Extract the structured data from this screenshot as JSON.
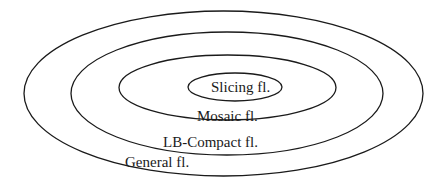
{
  "diagram": {
    "type": "nested-ellipses (Venn / set inclusion)",
    "colors": {
      "stroke": "#1a1a1a",
      "text": "#1a1a1a",
      "background": "#ffffff"
    },
    "sets": [
      {
        "id": "general",
        "label": "General fl.",
        "level": 0,
        "contains": "lb-compact"
      },
      {
        "id": "lb-compact",
        "label": "LB-Compact fl.",
        "level": 1,
        "contains": "mosaic"
      },
      {
        "id": "mosaic",
        "label": "Mosaic fl.",
        "level": 2,
        "contains": "slicing"
      },
      {
        "id": "slicing",
        "label": "Slicing fl.",
        "level": 3,
        "contains": null
      }
    ]
  }
}
